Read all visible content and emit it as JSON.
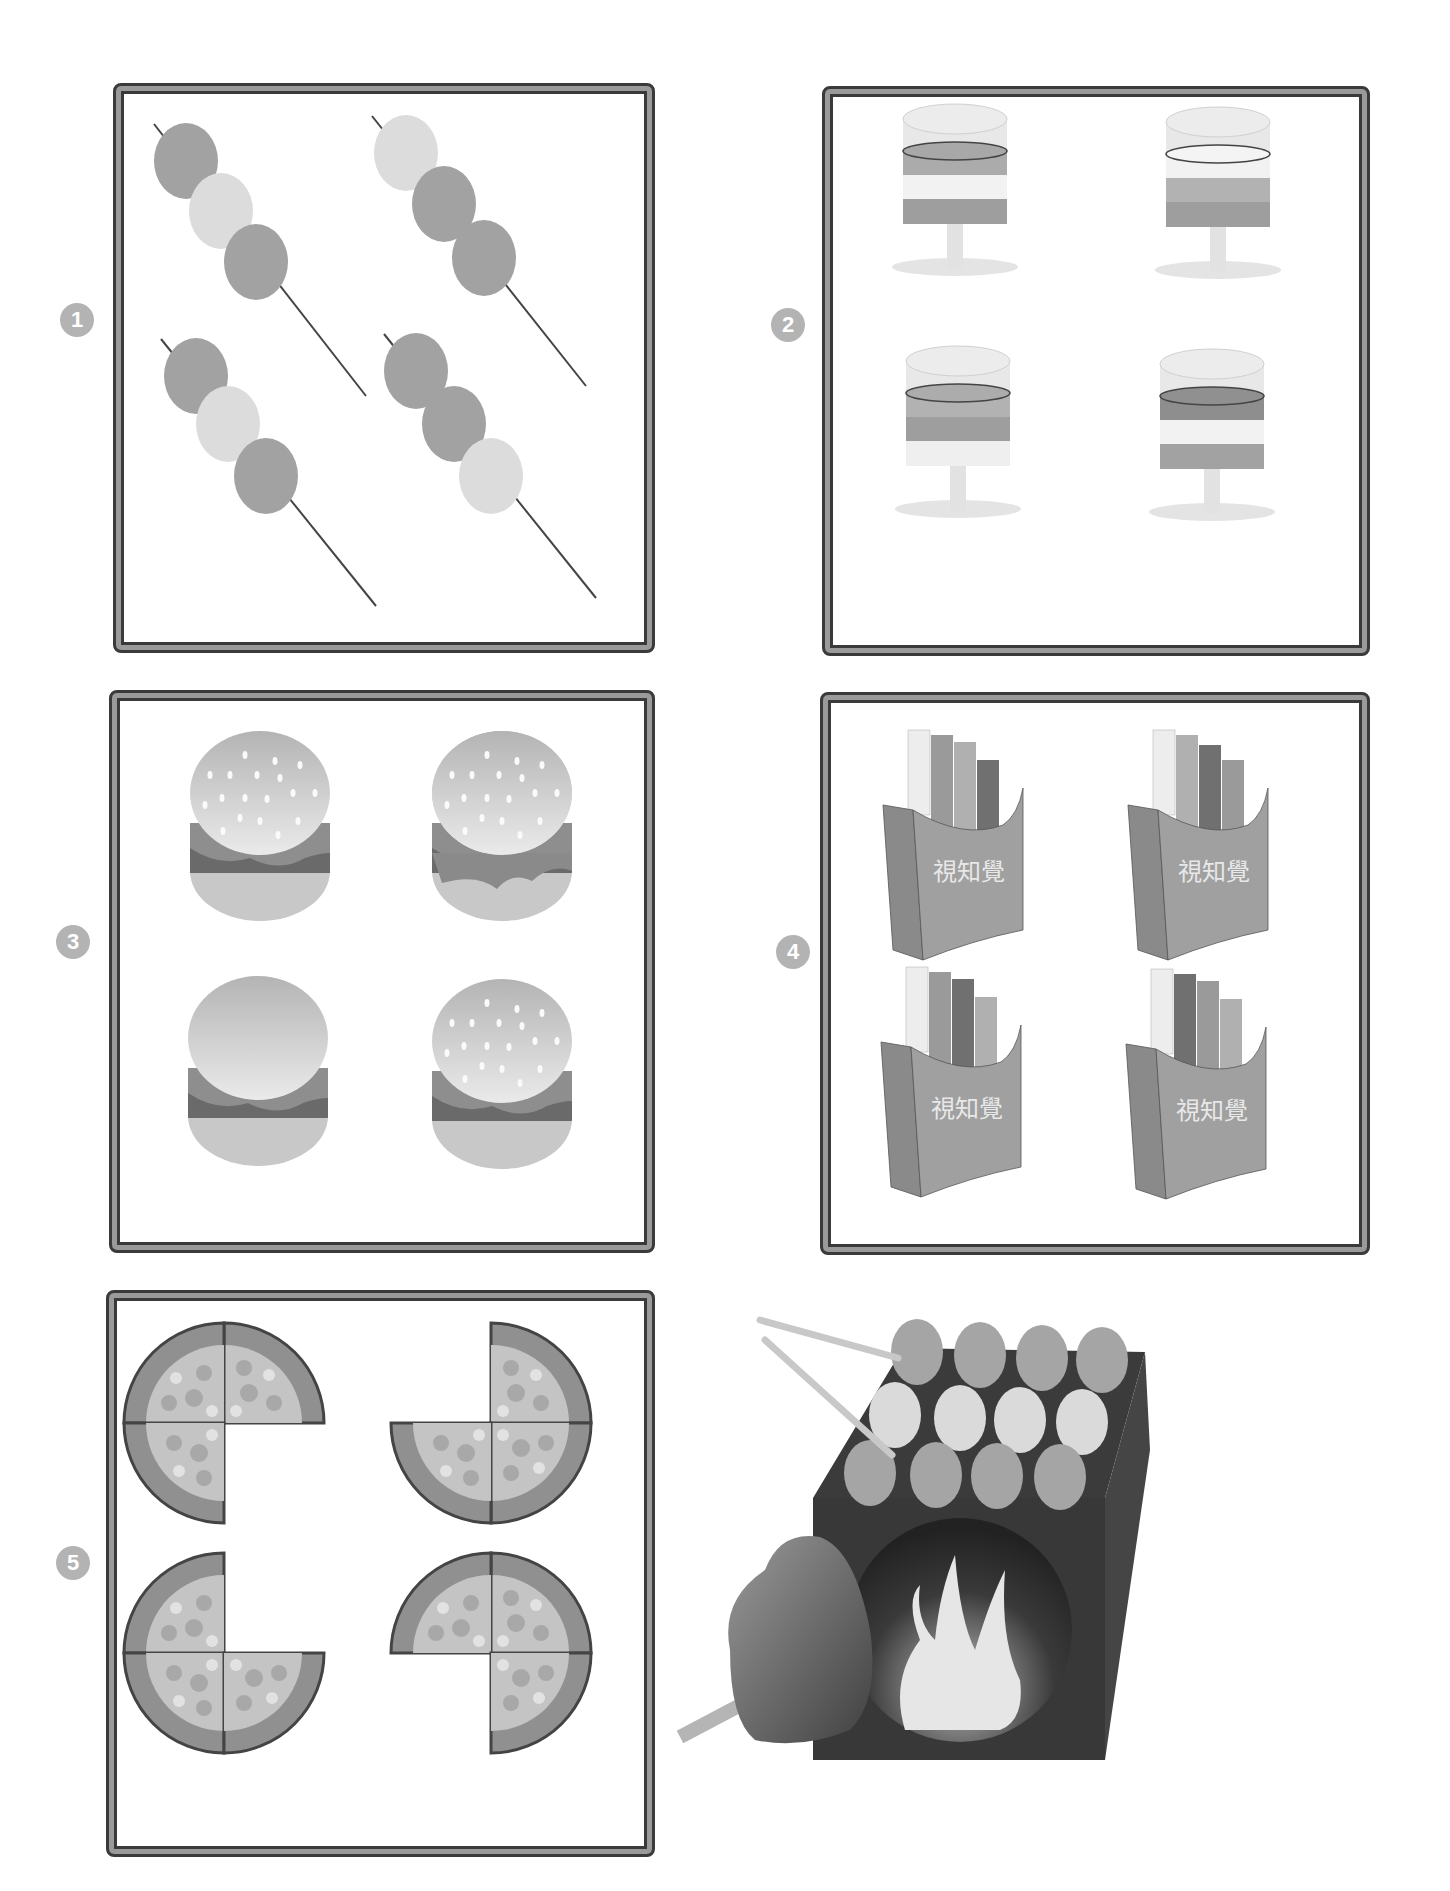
{
  "page": {
    "top_caption_cutoff": ""
  },
  "panels": [
    {
      "number": "1",
      "subject": "dango skewers",
      "items": [
        {
          "balls": [
            "dark",
            "light",
            "dark"
          ]
        },
        {
          "balls": [
            "light",
            "dark",
            "dark"
          ]
        },
        {
          "balls": [
            "dark",
            "light",
            "dark"
          ]
        },
        {
          "balls": [
            "dark",
            "dark",
            "light"
          ]
        }
      ]
    },
    {
      "number": "2",
      "subject": "layered drinks",
      "items": [
        {
          "layers": [
            "mid",
            "light",
            "dark"
          ]
        },
        {
          "layers": [
            "light",
            "mid",
            "dark"
          ]
        },
        {
          "layers": [
            "mid",
            "dark",
            "light"
          ]
        },
        {
          "layers": [
            "dark",
            "light",
            "mid"
          ]
        }
      ]
    },
    {
      "number": "3",
      "subject": "hamburgers",
      "items": [
        {
          "seeds": true
        },
        {
          "seeds": true,
          "cheese_drip": true
        },
        {
          "seeds": false
        },
        {
          "seeds": true
        }
      ]
    },
    {
      "number": "4",
      "subject": "french fries",
      "box_text": "視知覺",
      "items": [
        {
          "fries": [
            "#ededed",
            "#9a9a9a",
            "#b0b0b0",
            "#707070"
          ]
        },
        {
          "fries": [
            "#ededed",
            "#b0b0b0",
            "#707070",
            "#9a9a9a"
          ]
        },
        {
          "fries": [
            "#ededed",
            "#9a9a9a",
            "#707070",
            "#b0b0b0"
          ]
        },
        {
          "fries": [
            "#ededed",
            "#707070",
            "#9a9a9a",
            "#b0b0b0"
          ]
        }
      ]
    },
    {
      "number": "5",
      "subject": "pizza with missing quarter",
      "items": [
        {
          "missing": "bottom-right"
        },
        {
          "missing": "top-left"
        },
        {
          "missing": "top-right"
        },
        {
          "missing": "bottom-left"
        }
      ]
    }
  ],
  "illustration": {
    "subject": "grill stove with dango skewers, tongs and sweet potato"
  },
  "colors": {
    "frame_dark": "#3a3a3a",
    "frame_mid": "#9a9a9a",
    "badge": "#b3b3b3",
    "dark_ball": "#a2a2a2",
    "light_ball": "#dcdcdc"
  }
}
